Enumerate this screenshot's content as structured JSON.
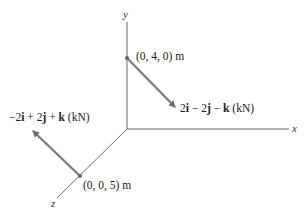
{
  "diagram": {
    "axes": {
      "x_label": "x",
      "y_label": "y",
      "z_label": "z",
      "axis_color": "#6b6b6b"
    },
    "points": [
      {
        "name": "point-a",
        "label": "(0, 4, 0) m"
      },
      {
        "name": "point-b",
        "label": "(0, 0, 5) m"
      }
    ],
    "forces": [
      {
        "name": "force-at-a",
        "label_parts": [
          "2",
          "i",
          " − 2",
          "j",
          " − ",
          "k",
          " (kN)"
        ],
        "color": "#7d7d7d"
      },
      {
        "name": "force-at-b",
        "label_parts": [
          "−2",
          "i",
          " + 2",
          "j",
          " + ",
          "k",
          " (kN)"
        ],
        "color": "#7d7d7d"
      }
    ]
  }
}
